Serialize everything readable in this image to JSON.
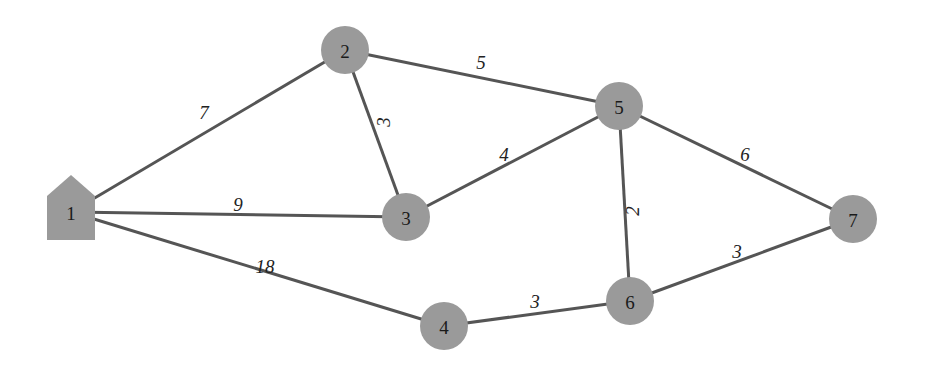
{
  "diagram": {
    "type": "weighted-network-graph",
    "colors": {
      "node_fill": "#9a9a9a",
      "edge_stroke": "#555555",
      "label": "#1a1a1a",
      "background": "#ffffff"
    },
    "nodes": [
      {
        "id": "1",
        "label": "1",
        "shape": "house",
        "x": 71,
        "y": 212
      },
      {
        "id": "2",
        "label": "2",
        "shape": "circle",
        "x": 345,
        "y": 50
      },
      {
        "id": "3",
        "label": "3",
        "shape": "circle",
        "x": 406,
        "y": 217
      },
      {
        "id": "4",
        "label": "4",
        "shape": "circle",
        "x": 444,
        "y": 326
      },
      {
        "id": "5",
        "label": "5",
        "shape": "circle",
        "x": 619,
        "y": 106
      },
      {
        "id": "6",
        "label": "6",
        "shape": "circle",
        "x": 630,
        "y": 301
      },
      {
        "id": "7",
        "label": "7",
        "shape": "circle",
        "x": 853,
        "y": 219
      }
    ],
    "edges": [
      {
        "from": "1",
        "to": "2",
        "weight": "7",
        "lx": 204,
        "ly": 112,
        "rot": 0
      },
      {
        "from": "1",
        "to": "3",
        "weight": "9",
        "lx": 238,
        "ly": 204,
        "rot": 0
      },
      {
        "from": "1",
        "to": "4",
        "weight": "18",
        "lx": 265,
        "ly": 266,
        "rot": 0
      },
      {
        "from": "2",
        "to": "3",
        "weight": "3",
        "lx": 383,
        "ly": 122,
        "rot": -90
      },
      {
        "from": "2",
        "to": "5",
        "weight": "5",
        "lx": 481,
        "ly": 62,
        "rot": 0
      },
      {
        "from": "3",
        "to": "5",
        "weight": "4",
        "lx": 504,
        "ly": 154,
        "rot": 0
      },
      {
        "from": "4",
        "to": "6",
        "weight": "3",
        "lx": 535,
        "ly": 301,
        "rot": 0
      },
      {
        "from": "5",
        "to": "6",
        "weight": "2",
        "lx": 632,
        "ly": 211,
        "rot": -90
      },
      {
        "from": "5",
        "to": "7",
        "weight": "6",
        "lx": 745,
        "ly": 154,
        "rot": 0
      },
      {
        "from": "6",
        "to": "7",
        "weight": "3",
        "lx": 737,
        "ly": 251,
        "rot": 0
      }
    ]
  }
}
